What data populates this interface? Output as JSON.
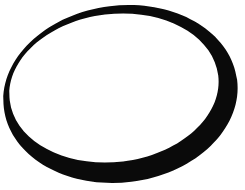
{
  "image": {
    "kind": "line-drawing",
    "subject": "hand-drawn ellipse outline",
    "width": 245,
    "height": 190,
    "background_color": "#ffffff",
    "ink_color": "#0a0a0a",
    "alt_text": "A thick black hand-drawn ellipse ring on a plain white background, the stroke heavy on the left and bottom and tapering to a hairline on the right."
  },
  "shape": {
    "name": "ellipse-ring",
    "fill_rule": "evenodd",
    "outer": {
      "cx": 120.5,
      "cy": 94.0,
      "rx": 117.5,
      "ry": 88.5,
      "rotation_deg": -7
    },
    "inner": {
      "cx": 114.0,
      "cy": 88.0,
      "rx": 105.0,
      "ry": 74.0,
      "rotation_deg": -7
    },
    "stroke_width_px": {
      "left": 21,
      "top": 10,
      "right": 1.5,
      "bottom": 17
    },
    "extents_px": {
      "left": 3,
      "top": 6,
      "right": 238,
      "bottom": 183
    }
  }
}
